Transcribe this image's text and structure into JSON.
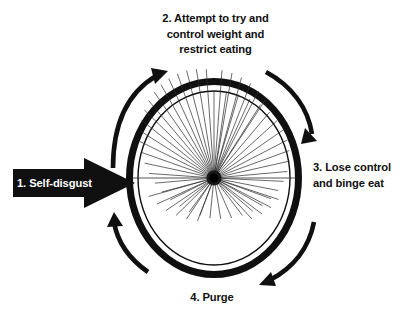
{
  "diagram": {
    "background_color": "#ffffff",
    "ink_color": "#101010",
    "rotation_direction": "clockwise",
    "steps": [
      {
        "id": "step-1",
        "number": "1.",
        "label": "1. Self-disgust",
        "position": "left",
        "style": "white-text-on-black-arrow"
      },
      {
        "id": "step-2",
        "number": "2.",
        "label": "2. Attempt to try and\ncontrol weight and\nrestrict eating",
        "position": "top",
        "style": "black-text"
      },
      {
        "id": "step-3",
        "number": "3.",
        "label": "3. Lose control\nand binge eat",
        "position": "right",
        "style": "black-text"
      },
      {
        "id": "step-4",
        "number": "4.",
        "label": "4. Purge",
        "position": "bottom",
        "style": "black-text"
      }
    ],
    "wheel": {
      "center_x": 214,
      "center_y": 178,
      "radius_x": 88,
      "radius_y": 100,
      "tire_thickness": 7,
      "spoke_count": 38,
      "hub_radius": 7,
      "color": "#101010"
    },
    "arrows": [
      {
        "id": "arc-arrow-top-left",
        "head_direction": "up-right"
      },
      {
        "id": "arc-arrow-top-right",
        "head_direction": "down-right"
      },
      {
        "id": "arc-arrow-bottom-right",
        "head_direction": "down-left"
      },
      {
        "id": "arc-arrow-bottom-left",
        "head_direction": "up-left"
      },
      {
        "id": "entry-arrow-left",
        "head_direction": "right"
      }
    ]
  }
}
